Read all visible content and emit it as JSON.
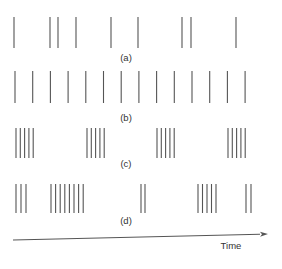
{
  "diagram": {
    "type": "spike-train-patterns",
    "rows": [
      {
        "label": "(a)",
        "description": "irregular spiking",
        "y_top": 17,
        "y_bottom": 48,
        "label_y": 61,
        "spikes_x": [
          14,
          50,
          58,
          76,
          111,
          138,
          182,
          191,
          236
        ]
      },
      {
        "label": "(b)",
        "description": "regular spiking",
        "y_top": 71,
        "y_bottom": 103,
        "label_y": 121,
        "spikes_x": [
          15,
          32.7,
          50.4,
          68.1,
          85.8,
          103.5,
          121.2,
          138.9,
          156.6,
          174.3,
          192,
          209.7,
          227.4,
          245.1
        ]
      },
      {
        "label": "(c)",
        "description": "regular bursting",
        "y_top": 128,
        "y_bottom": 158,
        "label_y": 167,
        "spikes_x": [
          16,
          20.3,
          24.6,
          28.9,
          33.2,
          87,
          91.3,
          95.6,
          99.9,
          104.2,
          157,
          161.3,
          165.6,
          169.9,
          174.2,
          228,
          232.3,
          236.6,
          240.9,
          245.2
        ]
      },
      {
        "label": "(d)",
        "description": "irregular bursting",
        "y_top": 184,
        "y_bottom": 213,
        "label_y": 224,
        "spikes_x": [
          16,
          21,
          26,
          51,
          55.6,
          60.2,
          64.8,
          69.4,
          74,
          78.6,
          83.2,
          141,
          145,
          198,
          202.5,
          207,
          211.5,
          216,
          246,
          251
        ]
      }
    ],
    "axis": {
      "label": "Time",
      "x1": 13,
      "y1": 240,
      "x2": 268,
      "y2": 234,
      "label_x": 231,
      "label_y": 249
    },
    "colors": {
      "spike": "#555555",
      "axis": "#555555",
      "text": "#333333",
      "background": "#ffffff"
    }
  }
}
